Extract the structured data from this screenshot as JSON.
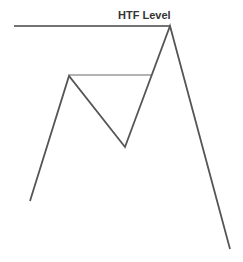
{
  "diagram": {
    "label": "HTF Level",
    "colors": {
      "line": "#555555",
      "level_line": "#444444",
      "inner_line": "#999999",
      "text": "#333333",
      "background": "#ffffff"
    }
  }
}
